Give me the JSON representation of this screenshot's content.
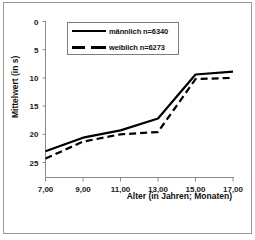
{
  "chart_data": {
    "type": "line",
    "title": "",
    "xlabel": "Alter (in Jahren; Monaten)",
    "ylabel": "Mittelwert (in s)",
    "x_tick_labels": [
      "7,00",
      "9,00",
      "11,00",
      "13,00",
      "15,00",
      "17,00"
    ],
    "x": [
      7,
      9,
      11,
      13,
      15,
      17
    ],
    "xlim": [
      7,
      17
    ],
    "y_tick_labels": [
      "0",
      "5",
      "10",
      "15",
      "20",
      "25"
    ],
    "y_ticks": [
      0,
      5,
      10,
      15,
      20,
      25
    ],
    "ylim": [
      0,
      26
    ],
    "y_axis_inverted": true,
    "grid": false,
    "legend_position": "top-center",
    "series": [
      {
        "name": "männlich n=6340",
        "style": "solid",
        "color": "#000000",
        "x": [
          7,
          9,
          11,
          13,
          15,
          17
        ],
        "values": [
          23.0,
          20.6,
          19.3,
          17.2,
          9.4,
          8.9
        ]
      },
      {
        "name": "weiblich n=6273",
        "style": "dashed",
        "color": "#000000",
        "x": [
          7,
          9,
          11,
          13,
          15,
          17
        ],
        "values": [
          24.3,
          21.3,
          20.0,
          19.6,
          10.2,
          10.0
        ]
      }
    ]
  },
  "legend": {
    "entries": [
      {
        "label": "männlich n=6340",
        "style": "solid"
      },
      {
        "label": "weiblich n=6273",
        "style": "dashed"
      }
    ]
  }
}
